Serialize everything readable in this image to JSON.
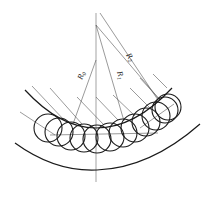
{
  "figure": {
    "type": "geometric-diagram",
    "labels": {
      "r0": {
        "main": "R",
        "sub": "0"
      },
      "r1": {
        "main": "R",
        "sub": "1"
      },
      "r2": {
        "main": "R",
        "sub": "2"
      }
    },
    "colors": {
      "stroke": "#1a1a1a",
      "thin_stroke": "#555555",
      "background": "#ffffff"
    },
    "roller_count": 12
  }
}
